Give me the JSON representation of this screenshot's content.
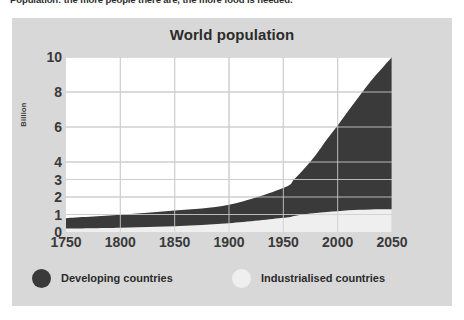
{
  "caption": {
    "text": "Population: the more people there are, the more food is needed."
  },
  "panel": {
    "background": "#d8d8d8"
  },
  "chart_data": {
    "type": "area",
    "title": "World population",
    "xlabel": "",
    "ylabel": "Billion",
    "xlim": [
      1750,
      2050
    ],
    "ylim": [
      0,
      10
    ],
    "grid": true,
    "legend_position": "bottom",
    "x_ticks": [
      1750,
      1800,
      1850,
      1900,
      1950,
      2000,
      2050
    ],
    "y_ticks": [
      0,
      1,
      2,
      3,
      4,
      6,
      8,
      10
    ],
    "colors": {
      "developing": "#3a3a3a",
      "industrialised": "#efefef",
      "plot_background": "#ffffff",
      "gridline": "#c9c9c9",
      "text": "#3a3a3a"
    },
    "x": [
      1750,
      1800,
      1850,
      1900,
      1950,
      1960,
      1970,
      1980,
      1990,
      2000,
      2010,
      2020,
      2030,
      2040,
      2050
    ],
    "series": [
      {
        "name": "Industrialised countries",
        "values": [
          0.2,
          0.25,
          0.33,
          0.5,
          0.81,
          0.92,
          1.01,
          1.08,
          1.15,
          1.19,
          1.24,
          1.27,
          1.29,
          1.3,
          1.3
        ]
      },
      {
        "name": "Developing countries",
        "values": [
          0.59,
          0.73,
          0.9,
          1.06,
          1.71,
          2.1,
          2.66,
          3.34,
          4.14,
          4.89,
          5.7,
          6.5,
          7.3,
          8.0,
          8.7
        ]
      }
    ],
    "totals": [
      0.79,
      0.98,
      1.23,
      1.56,
      2.52,
      3.02,
      3.67,
      4.42,
      5.29,
      6.08,
      6.94,
      7.77,
      8.59,
      9.3,
      10.0
    ],
    "legend": [
      {
        "label": "Developing countries",
        "swatch": "#3a3a3a"
      },
      {
        "label": "Industrialised countries",
        "swatch": "#efefef"
      }
    ]
  }
}
